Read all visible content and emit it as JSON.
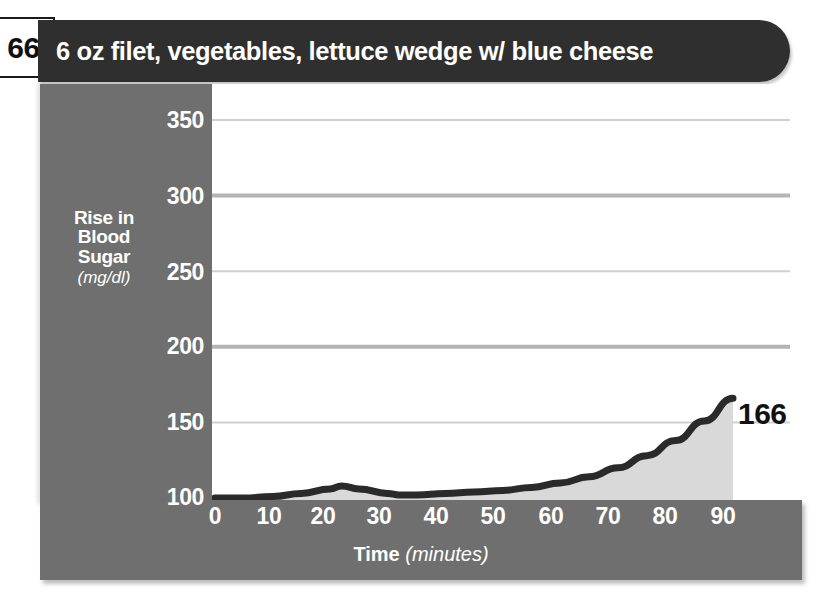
{
  "page": {
    "number": "66"
  },
  "title": {
    "text": "6 oz filet, vegetables, lettuce wedge w/ blue cheese"
  },
  "end_callout": {
    "value": "166"
  },
  "chart_data": {
    "type": "area",
    "title": "6 oz filet, vegetables, lettuce wedge w/ blue cheese",
    "xlabel_main": "Time",
    "xlabel_unit": "(minutes)",
    "ylabel_main": "Rise in Blood Sugar",
    "ylabel_line1": "Rise in",
    "ylabel_line2": "Blood",
    "ylabel_line3": "Sugar",
    "ylabel_unit": "(mg/dl)",
    "x": [
      0,
      5,
      10,
      15,
      20,
      22,
      25,
      30,
      32,
      35,
      40,
      45,
      50,
      55,
      60,
      65,
      70,
      75,
      80,
      85,
      90
    ],
    "values": [
      100,
      100,
      101,
      103,
      106,
      108,
      106,
      103,
      102,
      102,
      103,
      104,
      105,
      107,
      110,
      114,
      120,
      128,
      138,
      151,
      166
    ],
    "final_value": 166,
    "xticks": [
      "0",
      "10",
      "20",
      "30",
      "40",
      "50",
      "60",
      "70",
      "80",
      "90"
    ],
    "yticks": [
      "100",
      "150",
      "200",
      "250",
      "300",
      "350"
    ],
    "xlim": [
      0,
      90
    ],
    "ylim": [
      100,
      350
    ],
    "grid": true,
    "legend": "none",
    "series_color": "#2a2a2a",
    "fill_color": "#d9d9d9",
    "panel_color": "#6f6f6f",
    "title_bar_color": "#2f2f2f",
    "annotation": "166"
  }
}
